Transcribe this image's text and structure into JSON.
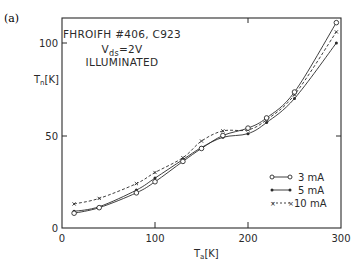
{
  "panel_label": "(a)",
  "annotation": {
    "line1": "FHROIFH #406, C923",
    "line2_main": "V",
    "line2_sub": "ds",
    "line2_rest": "=2V",
    "line3": "ILLUMINATED"
  },
  "axes": {
    "xlabel_main": "T",
    "xlabel_sub": "a",
    "xlabel_unit": "[K]",
    "ylabel_main": "T",
    "ylabel_sub": "n",
    "ylabel_unit": "[K]",
    "xticks": [
      "0",
      "100",
      "200",
      "300"
    ],
    "yticks": [
      "0",
      "50",
      "100"
    ]
  },
  "legend": [
    {
      "label": "3 mA",
      "style": "solid-open-circle"
    },
    {
      "label": "5 mA",
      "style": "solid-filled-dot"
    },
    {
      "label": "10 mA",
      "style": "dashed-cross"
    }
  ],
  "chart_data": {
    "type": "line",
    "title": "FHROIFH #406, C923  Vds=2V  ILLUMINATED",
    "xlabel": "Ta [K]",
    "ylabel": "Tn [K]",
    "xlim": [
      0,
      300
    ],
    "ylim": [
      0,
      120
    ],
    "grid": false,
    "legend_position": "lower right",
    "series": [
      {
        "name": "3 mA",
        "marker": "open circle",
        "line": "solid",
        "x": [
          13,
          40,
          80,
          100,
          130,
          150,
          173,
          200,
          220,
          250,
          295
        ],
        "y": [
          8,
          11,
          19,
          25,
          36,
          43,
          50,
          54,
          59.5,
          73.5,
          111
        ]
      },
      {
        "name": "5 mA",
        "marker": "filled dot",
        "line": "solid",
        "x": [
          13,
          40,
          80,
          100,
          130,
          150,
          173,
          200,
          220,
          250,
          295
        ],
        "y": [
          9,
          11.5,
          20.5,
          27,
          37,
          43.5,
          49,
          51,
          57,
          70,
          100
        ]
      },
      {
        "name": "10 mA",
        "marker": "cross",
        "line": "dashed",
        "x": [
          13,
          40,
          80,
          100,
          130,
          150,
          173,
          200,
          220,
          250,
          295
        ],
        "y": [
          13,
          16,
          24,
          30,
          38,
          47,
          52.5,
          53,
          58.5,
          72,
          106
        ]
      }
    ]
  }
}
